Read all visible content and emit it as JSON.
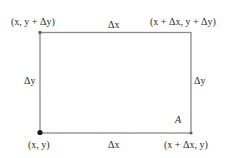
{
  "diagram": {
    "type": "rectangle-area-element",
    "colors": {
      "line": "#8a8a8a",
      "text": "#2a2a2a",
      "point": "#1a1a1a"
    },
    "corners": {
      "top_left": "(x, y + Δy)",
      "top_right": "(x + Δx, y + Δy)",
      "bottom_left": "(x, y)",
      "bottom_right": "(x + Δx, y)"
    },
    "edges": {
      "top": "Δx",
      "bottom": "Δx",
      "left": "Δy",
      "right": "Δy"
    },
    "region_label": "A"
  }
}
